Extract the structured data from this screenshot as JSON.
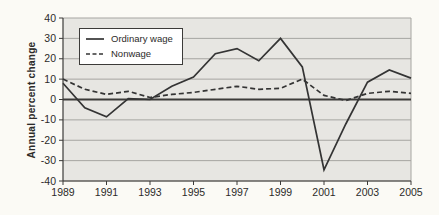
{
  "chart_data": {
    "type": "line",
    "title": "",
    "xlabel": "",
    "ylabel": "Annual percent change",
    "ylim": [
      -40,
      40
    ],
    "xlim": [
      1989,
      2005
    ],
    "grid": "horizontal",
    "legend_position": "top-left",
    "yticks": [
      40,
      30,
      20,
      10,
      0,
      -10,
      -20,
      -30,
      -40
    ],
    "xticks": [
      1989,
      1991,
      1993,
      1995,
      1997,
      1999,
      2001,
      2003,
      2005
    ],
    "x": [
      1989,
      1990,
      1991,
      1992,
      1993,
      1994,
      1995,
      1996,
      1997,
      1998,
      1999,
      2000,
      2001,
      2002,
      2003,
      2004,
      2005
    ],
    "series": [
      {
        "name": "Ordinary wage",
        "style": "solid",
        "values": [
          8,
          -4,
          -8.5,
          0.5,
          0,
          6.5,
          11,
          22.5,
          25,
          19,
          30,
          16,
          -34.5,
          -12,
          8.5,
          14.5,
          10.5
        ]
      },
      {
        "name": "Nonwage",
        "style": "dashed",
        "values": [
          10,
          5,
          2.5,
          4,
          1,
          2.5,
          3.5,
          5,
          6.5,
          5,
          5.5,
          10,
          2,
          -0.5,
          3,
          4,
          3
        ]
      }
    ],
    "colors": {
      "page_bg": "#fbfaf5",
      "plot_bg": "#e7e6e2",
      "grid": "#a6a5a1",
      "axis": "#3c3b39",
      "zero_line": "#3c3b39",
      "line": "#343434",
      "text": "#2c2b29",
      "legend_bg": "#ffffff"
    }
  }
}
